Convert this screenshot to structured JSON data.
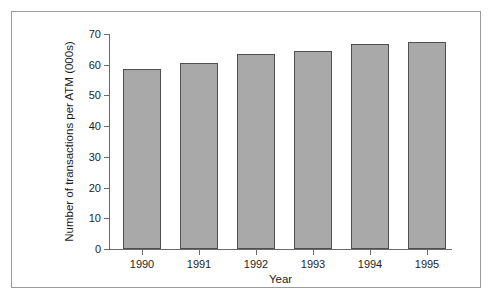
{
  "chart_data": {
    "type": "bar",
    "title": "",
    "subtitle": "",
    "xlabel": "Year",
    "ylabel": "Number of transactions per ATM (000s)",
    "categories": [
      "1990",
      "1991",
      "1992",
      "1993",
      "1994",
      "1995"
    ],
    "values": [
      58.6,
      60.5,
      63.5,
      64.5,
      66.8,
      67.4
    ],
    "series": [
      {
        "name": "Number of transactions per ATM (000s)",
        "values": [
          58.6,
          60.5,
          63.5,
          64.5,
          66.8,
          67.4
        ]
      }
    ],
    "ylim": [
      0,
      70
    ],
    "yticks": [
      0,
      10,
      20,
      30,
      40,
      50,
      60,
      70
    ],
    "ytick_labels": [
      "0",
      "10",
      "20",
      "30",
      "40",
      "50",
      "60",
      "70"
    ],
    "xtick_labels": [
      "1990",
      "1991",
      "1992",
      "1993",
      "1994",
      "1995"
    ],
    "grid": false,
    "legend": false,
    "legend_position": "none",
    "bar_fill_color": "#a9a9a9",
    "bar_edge_color": "#4f4f4f",
    "axis_color": "#6b6b6b",
    "text_color": "#1d1d1d",
    "background_color": "#ffffff",
    "frame_border_color": "#9a9a9a"
  }
}
